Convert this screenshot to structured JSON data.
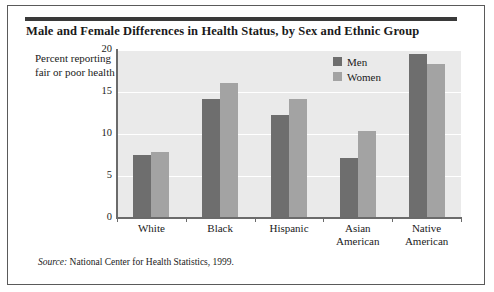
{
  "figure": {
    "title": "Male and Female Differences in Health Status, by Sex and Ethnic Group",
    "source_word": "Source:",
    "source_text": "National Center for Health Statistics, 1999."
  },
  "chart_data": {
    "type": "bar",
    "title": "Male and Female Differences in Health Status, by Sex and Ethnic Group",
    "xlabel": "",
    "ylabel": "Percent reporting fair or poor health",
    "categories": [
      "White",
      "Black",
      "Hispanic",
      "Asian American",
      "Native American"
    ],
    "series": [
      {
        "name": "Men",
        "color": "#6e6e6e",
        "values": [
          7.5,
          14.2,
          12.3,
          7.2,
          19.5
        ]
      },
      {
        "name": "Women",
        "color": "#a3a3a3",
        "values": [
          7.9,
          16.1,
          14.2,
          10.3,
          18.3
        ]
      }
    ],
    "ylim": [
      0,
      20
    ],
    "yticks": [
      0,
      5,
      10,
      15,
      20
    ],
    "ytick_labels": [
      "0",
      "5",
      "10",
      "15",
      "20"
    ],
    "grid": true,
    "grid_axis": "y",
    "legend_position": "top-right",
    "plot_background": "#eaeaea",
    "gridline_color": "#ffffff"
  },
  "legend": {
    "items": [
      {
        "label": "Men",
        "color": "#6e6e6e"
      },
      {
        "label": "Women",
        "color": "#a3a3a3"
      }
    ]
  }
}
